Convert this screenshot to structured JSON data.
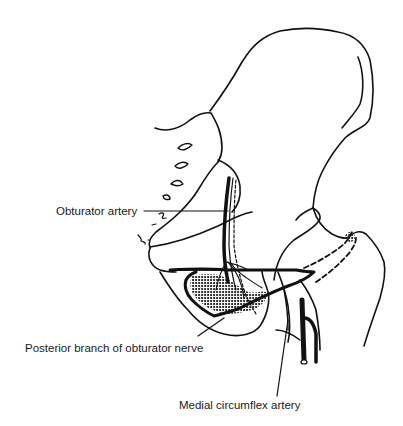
{
  "figure": {
    "style": "black line drawing on white",
    "colors": {
      "ink": "#111111",
      "background": "#ffffff"
    }
  },
  "labels": {
    "obturator_artery": "Obturator artery",
    "posterior_branch": "Posterior branch of obturator nerve",
    "medial_circumflex": "Medial circumflex artery"
  }
}
